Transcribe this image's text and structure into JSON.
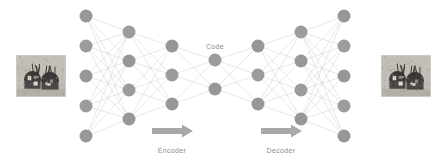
{
  "figure": {
    "background_color": "#ffffff",
    "width": 447,
    "height": 158
  },
  "labels": {
    "code": "Code",
    "encoder": "Encoder",
    "decoder": "Decoder"
  },
  "colors": {
    "node_fill": "#979797",
    "node_fill_alt": "#9c9c9c",
    "edge_stroke": "#cfcfcf",
    "arrow_fill": "#a8a8a8",
    "text": "#8e8e8e",
    "photo_border": "#cdc9c1"
  },
  "chart_data": {
    "type": "diagram",
    "subtype": "neural-network",
    "layer_sizes": [
      5,
      4,
      3,
      2,
      3,
      4,
      5
    ],
    "layers": [
      {
        "name": "input-layer",
        "count": 5,
        "x": 86,
        "ys": [
          16,
          46,
          76,
          106,
          136
        ]
      },
      {
        "name": "encoder-hidden-1",
        "count": 4,
        "x": 129,
        "ys": [
          32,
          61,
          90,
          119
        ]
      },
      {
        "name": "encoder-hidden-2",
        "count": 3,
        "x": 172,
        "ys": [
          46,
          75,
          104
        ]
      },
      {
        "name": "code-layer",
        "count": 2,
        "x": 215,
        "ys": [
          60,
          89
        ]
      },
      {
        "name": "decoder-hidden-1",
        "count": 3,
        "x": 258,
        "ys": [
          46,
          75,
          104
        ]
      },
      {
        "name": "decoder-hidden-2",
        "count": 4,
        "x": 301,
        "ys": [
          32,
          61,
          90,
          119
        ]
      },
      {
        "name": "output-layer",
        "count": 5,
        "x": 344,
        "ys": [
          16,
          46,
          76,
          106,
          136
        ]
      }
    ],
    "node_radius": 6.5,
    "annotations": [
      {
        "text": "Code",
        "x": 215,
        "y": 43
      },
      {
        "text": "Encoder",
        "x": 172,
        "y": 147
      },
      {
        "text": "Decoder",
        "x": 281,
        "y": 147
      }
    ],
    "arrows": [
      {
        "name": "encoder-arrow",
        "x1": 152,
        "x2": 193,
        "y": 131
      },
      {
        "name": "decoder-arrow",
        "x1": 261,
        "x2": 302,
        "y": 131
      }
    ],
    "images": [
      {
        "name": "input-image",
        "x": 16,
        "y": 55,
        "w": 50,
        "h": 42,
        "alt": "grayscale photo of machinery"
      },
      {
        "name": "output-image",
        "x": 381,
        "y": 55,
        "w": 50,
        "h": 42,
        "alt": "reconstructed grayscale photo of machinery"
      }
    ]
  }
}
